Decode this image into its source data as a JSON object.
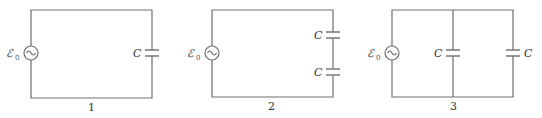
{
  "circuits": [
    {
      "number": "1",
      "source": {
        "symbol": "ℰ",
        "subscript": "0"
      },
      "capacitors": [
        {
          "label": "C"
        }
      ]
    },
    {
      "number": "2",
      "source": {
        "symbol": "ℰ",
        "subscript": "0"
      },
      "capacitors": [
        {
          "label": "C"
        },
        {
          "label": "C"
        }
      ]
    },
    {
      "number": "3",
      "source": {
        "symbol": "ℰ",
        "subscript": "0"
      },
      "capacitors": [
        {
          "label": "C"
        },
        {
          "label": "C"
        }
      ]
    }
  ],
  "colors": {
    "wire": "#6e6e6e",
    "text": "#333333"
  }
}
